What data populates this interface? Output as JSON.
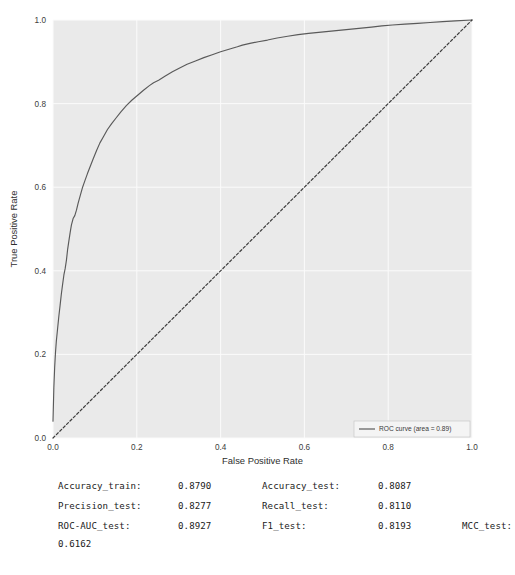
{
  "chart_data": {
    "type": "line",
    "title": "",
    "xlabel": "False Positive Rate",
    "ylabel": "True Positive Rate",
    "xlim": [
      0.0,
      1.0
    ],
    "ylim": [
      0.0,
      1.0
    ],
    "xticks": [
      "0.0",
      "0.2",
      "0.4",
      "0.6",
      "0.8",
      "1.0"
    ],
    "yticks": [
      "0.0",
      "0.2",
      "0.4",
      "0.6",
      "0.8",
      "1.0"
    ],
    "grid": true,
    "legend_position": "lower right",
    "series": [
      {
        "name": "ROC curve (area = 0.89)",
        "style": "solid",
        "color": "#5a5a5a",
        "points": [
          [
            0.0,
            0.04
          ],
          [
            0.002,
            0.12
          ],
          [
            0.004,
            0.17
          ],
          [
            0.006,
            0.205
          ],
          [
            0.008,
            0.232
          ],
          [
            0.011,
            0.262
          ],
          [
            0.014,
            0.292
          ],
          [
            0.017,
            0.318
          ],
          [
            0.02,
            0.345
          ],
          [
            0.023,
            0.368
          ],
          [
            0.026,
            0.39
          ],
          [
            0.029,
            0.405
          ],
          [
            0.032,
            0.425
          ],
          [
            0.035,
            0.452
          ],
          [
            0.038,
            0.472
          ],
          [
            0.041,
            0.492
          ],
          [
            0.044,
            0.51
          ],
          [
            0.048,
            0.525
          ],
          [
            0.052,
            0.532
          ],
          [
            0.056,
            0.545
          ],
          [
            0.06,
            0.562
          ],
          [
            0.065,
            0.58
          ],
          [
            0.07,
            0.598
          ],
          [
            0.076,
            0.615
          ],
          [
            0.082,
            0.632
          ],
          [
            0.089,
            0.65
          ],
          [
            0.096,
            0.668
          ],
          [
            0.104,
            0.688
          ],
          [
            0.112,
            0.706
          ],
          [
            0.121,
            0.722
          ],
          [
            0.13,
            0.738
          ],
          [
            0.14,
            0.752
          ],
          [
            0.15,
            0.765
          ],
          [
            0.162,
            0.78
          ],
          [
            0.175,
            0.795
          ],
          [
            0.188,
            0.808
          ],
          [
            0.202,
            0.82
          ],
          [
            0.216,
            0.832
          ],
          [
            0.23,
            0.843
          ],
          [
            0.24,
            0.85
          ],
          [
            0.252,
            0.856
          ],
          [
            0.268,
            0.866
          ],
          [
            0.285,
            0.876
          ],
          [
            0.3,
            0.884
          ],
          [
            0.32,
            0.894
          ],
          [
            0.34,
            0.902
          ],
          [
            0.36,
            0.91
          ],
          [
            0.38,
            0.917
          ],
          [
            0.4,
            0.924
          ],
          [
            0.42,
            0.93
          ],
          [
            0.44,
            0.936
          ],
          [
            0.452,
            0.94
          ],
          [
            0.47,
            0.944
          ],
          [
            0.49,
            0.948
          ],
          [
            0.512,
            0.952
          ],
          [
            0.535,
            0.957
          ],
          [
            0.56,
            0.961
          ],
          [
            0.585,
            0.965
          ],
          [
            0.61,
            0.968
          ],
          [
            0.64,
            0.971
          ],
          [
            0.67,
            0.974
          ],
          [
            0.7,
            0.977
          ],
          [
            0.73,
            0.98
          ],
          [
            0.76,
            0.983
          ],
          [
            0.785,
            0.986
          ],
          [
            0.81,
            0.988
          ],
          [
            0.84,
            0.99
          ],
          [
            0.87,
            0.992
          ],
          [
            0.9,
            0.994
          ],
          [
            0.93,
            0.996
          ],
          [
            0.96,
            0.998
          ],
          [
            1.0,
            1.0
          ]
        ]
      },
      {
        "name": "chance-diagonal",
        "style": "dashed",
        "color": "#3d3d3d",
        "points": [
          [
            0.0,
            0.0
          ],
          [
            1.0,
            1.0
          ]
        ]
      }
    ],
    "legend_entries": [
      {
        "label": "ROC curve (area = 0.89)",
        "color": "#5a5a5a",
        "style": "solid"
      }
    ]
  },
  "metrics": {
    "rows": [
      [
        {
          "key": "Accuracy_train:",
          "value": "0.8790"
        },
        {
          "key": "Accuracy_test:",
          "value": "0.8087"
        }
      ],
      [
        {
          "key": "Precision_test:",
          "value": "0.8277"
        },
        {
          "key": "Recall_test:",
          "value": "0.8110"
        }
      ],
      [
        {
          "key": "ROC-AUC_test:",
          "value": "0.8927"
        },
        {
          "key": "F1_test:",
          "value": "0.8193"
        },
        {
          "key": "MCC_test:",
          "value": ""
        }
      ]
    ],
    "wrapped_value": "0.6162"
  },
  "colors": {
    "plot_background": "#eaeaea",
    "page_background": "#ffffff",
    "grid": "#fbfbfb",
    "curve": "#5a5a5a",
    "diagonal": "#3d3d3d",
    "text": "#1b1b1b"
  }
}
